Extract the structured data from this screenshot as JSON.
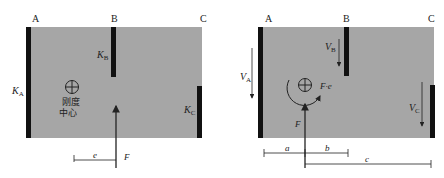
{
  "left": {
    "walls": {
      "A": "A",
      "B": "B",
      "C": "C"
    },
    "stiffness": {
      "KA_main": "K",
      "KA_sub": "A",
      "KB_main": "K",
      "KB_sub": "B",
      "KC_main": "K",
      "KC_sub": "C"
    },
    "center_label_1": "刚度",
    "center_label_2": "中心",
    "force": "F",
    "eccentricity": "e"
  },
  "right": {
    "walls": {
      "A": "A",
      "B": "B",
      "C": "C"
    },
    "shears": {
      "VA_main": "V",
      "VA_sub": "A",
      "VB_main": "V",
      "VB_sub": "B",
      "VC_main": "V",
      "VC_sub": "C"
    },
    "moment": "F·e",
    "force": "F",
    "dims": {
      "a": "a",
      "b": "b",
      "c": "c"
    }
  },
  "colors": {
    "slab": "#a6a6a6",
    "wall": "#111111",
    "line": "#222222"
  }
}
